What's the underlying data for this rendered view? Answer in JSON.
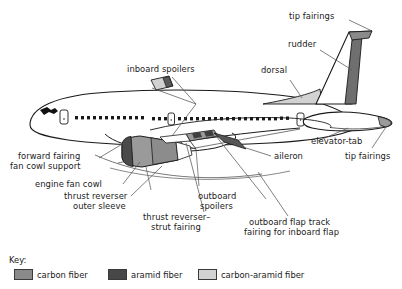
{
  "labels": {
    "tip_fairings_top": "tip fairings",
    "rudder": "rudder",
    "dorsal": "dorsal",
    "inboard_spoilers": "inboard spoilers",
    "elevator_tab": "elevator-tab",
    "tip_fairings_right": "tip fairings",
    "aileron": "aileron",
    "forward_fairing_l1": "forward fairing",
    "forward_fairing_l2": "fan cowl support",
    "engine_fan_cowl": "engine fan cowl",
    "thrust_reverser_l1": "thrust reverser",
    "thrust_reverser_l2": "outer sleeve",
    "thrust_strut_l1": "thrust reverser–",
    "thrust_strut_l2": "strut fairing",
    "outboard_spoilers_l1": "outboard",
    "outboard_spoilers_l2": "spoilers",
    "outboard_flap_l1": "outboard flap track",
    "outboard_flap_l2": "fairing for inboard flap"
  },
  "key": {
    "heading": "Key:",
    "items": [
      {
        "label": "carbon fiber",
        "color": "#8a8a8a"
      },
      {
        "label": "aramid fiber",
        "color": "#474747"
      },
      {
        "label": "carbon-aramid fiber",
        "color": "#d2d2d2"
      }
    ]
  },
  "colors": {
    "outline": "#1a1a1a",
    "carbon_fiber": "#8a8a8a",
    "aramid_fiber": "#474747",
    "carbon_aramid_fiber": "#d2d2d2",
    "leader_line": "#555555",
    "background": "#ffffff"
  }
}
